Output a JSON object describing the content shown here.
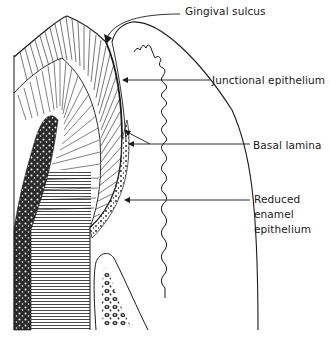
{
  "diagram": {
    "type": "histological-illustration",
    "colors": {
      "ink": "#1a1a1a",
      "background": "#ffffff"
    },
    "labels": [
      {
        "id": "gingival-sulcus",
        "text": "Gingival sulcus",
        "x": 185,
        "y": 4
      },
      {
        "id": "junctional-epithelium",
        "text": "Junctional epithelium",
        "x": 212,
        "y": 73
      },
      {
        "id": "basal-lamina",
        "text": "Basal lamina",
        "x": 253,
        "y": 138
      },
      {
        "id": "reduced-enamel-epithelium",
        "text": "Reduced enamel epithelium",
        "lines": [
          "Reduced",
          "enamel",
          "epithelium"
        ],
        "x": 254,
        "y": 191
      }
    ],
    "structures": [
      "Enamel",
      "Dentin",
      "Pulp",
      "Gingiva",
      "Alveolar bone crest",
      "Oral epithelium"
    ]
  }
}
